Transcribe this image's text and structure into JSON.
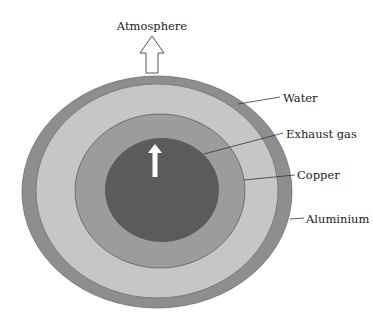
{
  "diagram": {
    "type": "concentric-layer cross-section",
    "top_label": "Atmosphere",
    "layers": [
      {
        "name": "Aluminium",
        "color": "#8e8e8e"
      },
      {
        "name": "Water",
        "color": "#c6c6c6"
      },
      {
        "name": "Copper",
        "color": "#9c9c9c"
      },
      {
        "name": "Exhaust gas",
        "color": "#5b5b5b"
      }
    ],
    "labels": {
      "water": "Water",
      "exhaust_gas": "Exhaust gas",
      "copper": "Copper",
      "aluminium": "Aluminium"
    },
    "arrows": {
      "outlet": "hollow arrow up to atmosphere",
      "flow": "white arrow up in exhaust gas"
    }
  }
}
